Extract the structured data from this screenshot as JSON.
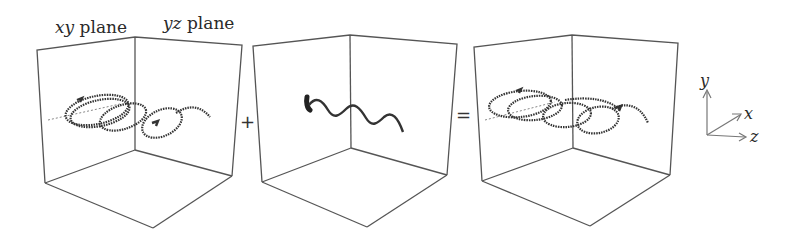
{
  "labels": {
    "xy_plane": "xy plane",
    "xy_plane_var": "xy",
    "xy_plane_word": " plane",
    "yz_plane_var": "yz",
    "yz_plane_word": " plane"
  },
  "operators": {
    "plus": "+",
    "equals": "="
  },
  "axes": {
    "y": "y",
    "x": "x",
    "z": "z"
  },
  "panels": [
    {
      "name": "circular-helix",
      "description": "helical path spiralling along z with loops"
    },
    {
      "name": "wave",
      "description": "sinusoidal wave in yz plane"
    },
    {
      "name": "combined-helix",
      "description": "sum of helix and wave"
    }
  ],
  "colors": {
    "line": "#555555",
    "curve": "#333333",
    "text": "#2a2a2a"
  }
}
